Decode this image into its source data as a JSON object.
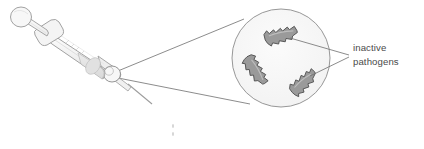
{
  "figure": {
    "kind": "vaccine-syringe-magnification-diagram",
    "background_color": "#ffffff"
  },
  "callout": {
    "label_line1": "inactive",
    "label_line2": "pathogens",
    "text_color": "#4a4a4a"
  },
  "magnifier": {
    "center_x": 281,
    "center_y": 58,
    "radius": 49,
    "fill_color": "#f7f7f7",
    "stroke_color": "#8c8c8c"
  },
  "pathogens": [
    {
      "id": "pathogen-top",
      "cx": 281,
      "cy": 35,
      "angle": -14,
      "length": 33,
      "width": 11
    },
    {
      "id": "pathogen-left",
      "cx": 256,
      "cy": 70,
      "angle": 58,
      "length": 31,
      "width": 10
    },
    {
      "id": "pathogen-right",
      "cx": 303,
      "cy": 82,
      "angle": -42,
      "length": 29,
      "width": 10
    }
  ],
  "pathogen_style": {
    "fill_color": "#9a9a9a",
    "stroke_color": "#4f4f4f"
  },
  "syringe": {
    "body_fill": "#f4f4f4",
    "stroke_color": "#9d9d9d",
    "parts": [
      "plunger-thumb-pad",
      "plunger-rod",
      "barrel-flange",
      "barrel",
      "liquid-chamber",
      "tip-hub",
      "needle"
    ]
  },
  "leader_lines": {
    "stroke_color": "#6f6f6f",
    "source_point_x": 112,
    "source_point_y": 74
  }
}
